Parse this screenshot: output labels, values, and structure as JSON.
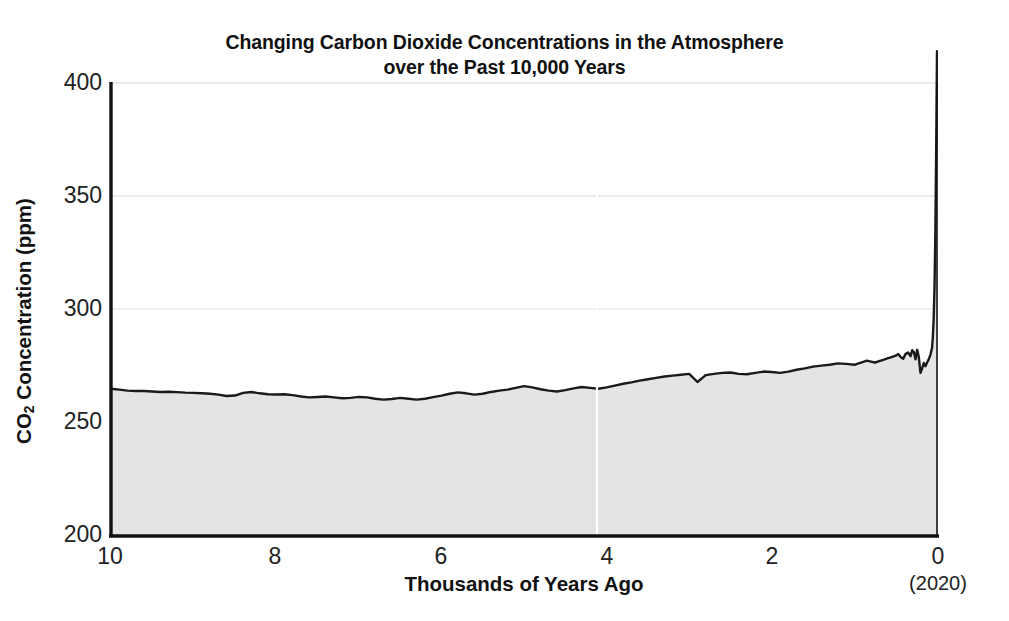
{
  "figure": {
    "title_line1": "Changing Carbon Dioxide Concentrations in the Atmosphere",
    "title_line2": "over the Past 10,000 Years",
    "background_color": "#ffffff"
  },
  "axes": {
    "y_label_pre": "CO",
    "y_label_sub": "2",
    "y_label_post": " Concentration (ppm)",
    "y_label_full": "CO2 Concentration (ppm)",
    "x_label": "Thousands of Years Ago",
    "x_axis_note": "(2020)",
    "y_ticks": [
      "400",
      "350",
      "300",
      "250",
      "200"
    ],
    "x_ticks": [
      "10",
      "8",
      "6",
      "4",
      "2",
      "0"
    ]
  },
  "chart_data": {
    "type": "area",
    "title": "Changing Carbon Dioxide Concentrations in the Atmosphere over the Past 10,000 Years",
    "xlabel": "Thousands of Years Ago",
    "ylabel": "CO2 Concentration (ppm)",
    "x_axis_note": "(2020)",
    "xlim": [
      10,
      0
    ],
    "ylim": [
      200,
      400
    ],
    "x_inverted": true,
    "y_ticks": [
      200,
      250,
      300,
      350,
      400
    ],
    "x_ticks": [
      10,
      8,
      6,
      4,
      2,
      0
    ],
    "grid": "horizontal",
    "legend": "none",
    "line_color": "#1a1a1a",
    "fill_color": "#e4e4e4",
    "x_unit": "thousands of years before present",
    "y_unit": "ppm",
    "series": [
      {
        "name": "Atmospheric CO2 concentration",
        "x": [
          10.0,
          9.9,
          9.8,
          9.7,
          9.6,
          9.5,
          9.4,
          9.3,
          9.2,
          9.1,
          9.0,
          8.9,
          8.8,
          8.7,
          8.6,
          8.5,
          8.4,
          8.3,
          8.2,
          8.1,
          8.0,
          7.9,
          7.8,
          7.7,
          7.6,
          7.5,
          7.4,
          7.3,
          7.2,
          7.1,
          7.0,
          6.9,
          6.8,
          6.7,
          6.6,
          6.5,
          6.4,
          6.3,
          6.2,
          6.1,
          6.0,
          5.9,
          5.8,
          5.7,
          5.6,
          5.5,
          5.4,
          5.3,
          5.2,
          5.1,
          5.0,
          4.9,
          4.8,
          4.7,
          4.6,
          4.5,
          4.4,
          4.3,
          4.2,
          4.1,
          4.0,
          3.9,
          3.8,
          3.7,
          3.6,
          3.5,
          3.4,
          3.3,
          3.2,
          3.1,
          3.0,
          2.9,
          2.8,
          2.7,
          2.6,
          2.5,
          2.4,
          2.3,
          2.2,
          2.1,
          2.0,
          1.9,
          1.8,
          1.7,
          1.6,
          1.5,
          1.4,
          1.3,
          1.2,
          1.1,
          1.0,
          0.95,
          0.9,
          0.85,
          0.8,
          0.75,
          0.7,
          0.65,
          0.6,
          0.55,
          0.5,
          0.47,
          0.44,
          0.41,
          0.38,
          0.35,
          0.32,
          0.3,
          0.28,
          0.26,
          0.24,
          0.22,
          0.2,
          0.18,
          0.16,
          0.14,
          0.12,
          0.1,
          0.08,
          0.06,
          0.05,
          0.04,
          0.03,
          0.02,
          0.01,
          0.0
        ],
        "y": [
          265.0,
          264.6,
          264.2,
          264.0,
          264.0,
          263.8,
          263.6,
          263.7,
          263.5,
          263.3,
          263.2,
          263.0,
          262.8,
          262.4,
          261.8,
          262.0,
          263.2,
          263.6,
          263.0,
          262.6,
          262.5,
          262.6,
          262.2,
          261.6,
          261.2,
          261.4,
          261.6,
          261.2,
          260.8,
          261.0,
          261.4,
          261.2,
          260.6,
          260.2,
          260.5,
          261.0,
          260.6,
          260.2,
          260.6,
          261.3,
          262.0,
          262.8,
          263.4,
          263.0,
          262.4,
          262.8,
          263.6,
          264.2,
          264.6,
          265.4,
          266.2,
          265.6,
          264.8,
          264.2,
          263.8,
          264.4,
          265.2,
          265.8,
          265.4,
          265.0,
          265.6,
          266.4,
          267.2,
          267.8,
          268.6,
          269.2,
          269.8,
          270.4,
          270.8,
          271.2,
          271.6,
          268.0,
          271.0,
          271.6,
          272.0,
          272.2,
          271.6,
          271.4,
          272.0,
          272.6,
          272.4,
          272.0,
          272.6,
          273.4,
          274.0,
          274.8,
          275.2,
          275.6,
          276.2,
          276.0,
          275.6,
          276.2,
          276.8,
          277.4,
          277.0,
          276.6,
          277.2,
          277.8,
          278.4,
          279.0,
          279.6,
          280.4,
          279.0,
          278.2,
          280.4,
          281.0,
          279.4,
          282.0,
          281.2,
          278.0,
          282.2,
          279.0,
          272.0,
          274.0,
          276.4,
          275.0,
          276.6,
          278.0,
          280.0,
          283.0,
          288.0,
          296.0,
          310.0,
          334.0,
          370.0,
          414.0
        ]
      }
    ],
    "annotations": [
      {
        "text": "(2020)",
        "position": "below x=0 tick",
        "meaning": "present day year label"
      }
    ],
    "summary": {
      "start_value_ppm": 265,
      "minimum_ppm": 260,
      "minimum_at_ka": 6.8,
      "preindustrial_ppm": 280,
      "final_value_ppm": 414,
      "final_year": "2020"
    }
  }
}
